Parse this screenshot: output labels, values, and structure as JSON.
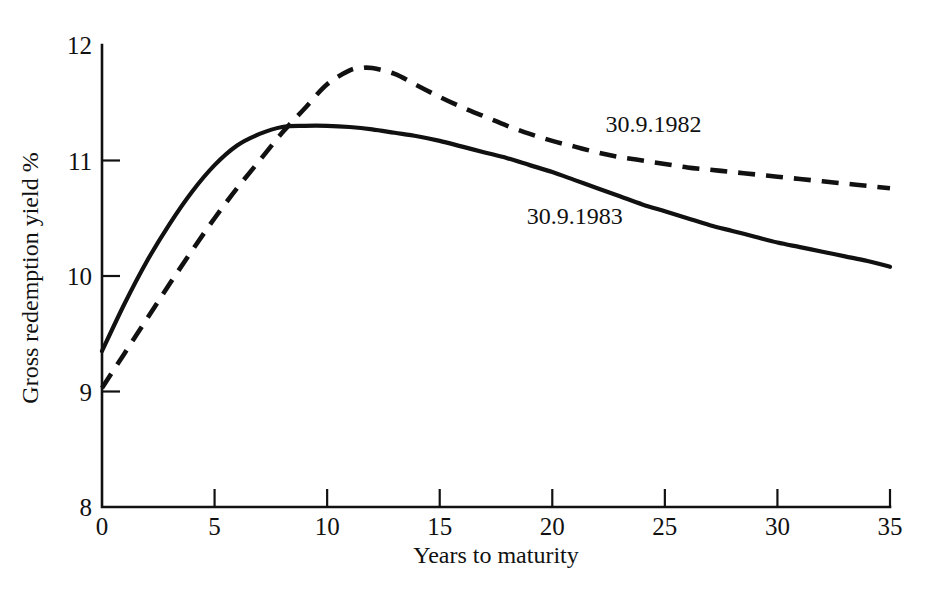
{
  "chart_data": {
    "type": "line",
    "title": "",
    "xlabel": "Years to maturity",
    "ylabel": "Gross redemption yield %",
    "xlim": [
      0,
      35
    ],
    "ylim": [
      8,
      12
    ],
    "xticks": [
      0,
      5,
      10,
      15,
      20,
      25,
      30,
      35
    ],
    "xtick_labels": [
      "0",
      "5",
      "10",
      "15",
      "20",
      "25",
      "30",
      "35"
    ],
    "yticks": [
      8,
      9,
      10,
      11,
      12
    ],
    "ytick_labels": [
      "8",
      "9",
      "10",
      "11",
      "12"
    ],
    "grid": false,
    "legend_position": "inline-annotation",
    "series": [
      {
        "name": "30.9.1982",
        "style": "dashed",
        "label_x": 24.5,
        "label_y": 11.25,
        "x": [
          0,
          1,
          2,
          3,
          4,
          5,
          6,
          7,
          8,
          9,
          10,
          11,
          11.5,
          12,
          13,
          14,
          15,
          16,
          17,
          18,
          19,
          20,
          21,
          22,
          23,
          24,
          25,
          26,
          27,
          28,
          29,
          30,
          31,
          32,
          33,
          34,
          35
        ],
        "values": [
          9.03,
          9.33,
          9.63,
          9.93,
          10.22,
          10.5,
          10.76,
          11.0,
          11.24,
          11.45,
          11.66,
          11.78,
          11.8,
          11.8,
          11.75,
          11.65,
          11.55,
          11.46,
          11.38,
          11.3,
          11.23,
          11.17,
          11.12,
          11.07,
          11.03,
          11.0,
          10.97,
          10.94,
          10.92,
          10.9,
          10.88,
          10.86,
          10.84,
          10.82,
          10.8,
          10.78,
          10.76
        ]
      },
      {
        "name": "30.9.1983",
        "style": "solid",
        "label_x": 21.0,
        "label_y": 10.45,
        "x": [
          0,
          1,
          2,
          3,
          4,
          5,
          6,
          7,
          8,
          9,
          10,
          11,
          12,
          13,
          14,
          15,
          16,
          17,
          18,
          19,
          20,
          21,
          22,
          23,
          24,
          25,
          26,
          27,
          28,
          29,
          30,
          31,
          32,
          33,
          34,
          35
        ],
        "values": [
          9.35,
          9.76,
          10.13,
          10.45,
          10.73,
          10.96,
          11.13,
          11.23,
          11.29,
          11.3,
          11.3,
          11.29,
          11.27,
          11.24,
          11.21,
          11.17,
          11.12,
          11.07,
          11.02,
          10.96,
          10.9,
          10.83,
          10.76,
          10.69,
          10.62,
          10.56,
          10.5,
          10.44,
          10.39,
          10.34,
          10.29,
          10.25,
          10.21,
          10.17,
          10.13,
          10.08
        ]
      }
    ],
    "colors": {
      "series_1982": "#111111",
      "series_1983": "#111111",
      "axis": "#111111",
      "background": "#ffffff"
    }
  }
}
